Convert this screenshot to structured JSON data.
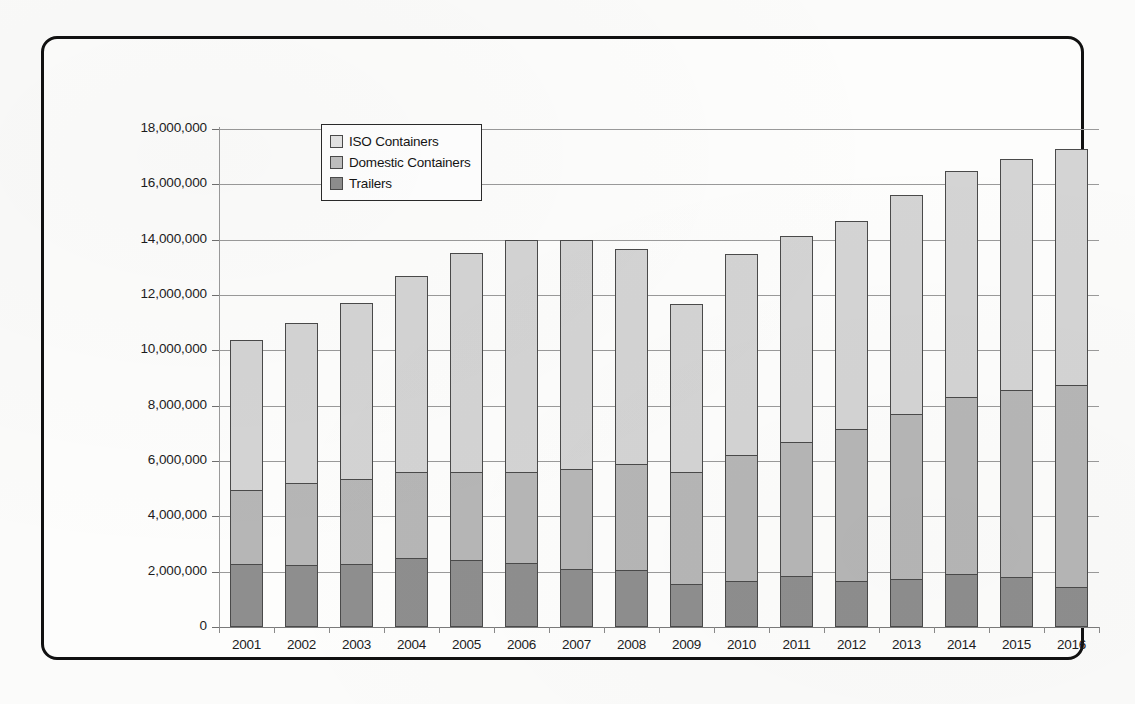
{
  "chart_data": {
    "type": "bar",
    "stacked": true,
    "title": "",
    "xlabel": "",
    "ylabel": "",
    "grid": true,
    "legend_position": "top-left-inside",
    "ylim": [
      0,
      18000000
    ],
    "yticks": [
      0,
      2000000,
      4000000,
      6000000,
      8000000,
      10000000,
      12000000,
      14000000,
      16000000,
      18000000
    ],
    "ytick_labels": [
      "0",
      "2,000,000",
      "4,000,000",
      "6,000,000",
      "8,000,000",
      "10,000,000",
      "12,000,000",
      "14,000,000",
      "16,000,000",
      "18,000,000"
    ],
    "categories": [
      "2001",
      "2002",
      "2003",
      "2004",
      "2005",
      "2006",
      "2007",
      "2008",
      "2009",
      "2010",
      "2011",
      "2012",
      "2013",
      "2014",
      "2015",
      "2016"
    ],
    "series": [
      {
        "name": "Trailers",
        "color": "#8e8e8e",
        "values": [
          2270000,
          2230000,
          2280000,
          2500000,
          2430000,
          2300000,
          2100000,
          2050000,
          1570000,
          1680000,
          1830000,
          1650000,
          1740000,
          1900000,
          1790000,
          1430000
        ]
      },
      {
        "name": "Domestic Containers",
        "color": "#b6b6b6",
        "values": [
          2680000,
          2970000,
          3070000,
          3100000,
          3170000,
          3300000,
          3600000,
          3850000,
          4030000,
          4520000,
          4870000,
          5500000,
          5960000,
          6400000,
          6760000,
          7320000
        ]
      },
      {
        "name": "ISO Containers",
        "color": "#d4d4d4",
        "values": [
          5420000,
          5800000,
          6370000,
          7100000,
          7930000,
          8400000,
          8280000,
          7780000,
          6060000,
          7270000,
          7450000,
          7530000,
          7930000,
          8190000,
          8380000,
          8540000
        ]
      }
    ],
    "stack_tops": {
      "trailers": [
        2270000,
        2230000,
        2280000,
        2500000,
        2430000,
        2300000,
        2100000,
        2050000,
        1570000,
        1680000,
        1830000,
        1650000,
        1740000,
        1900000,
        1790000,
        1430000
      ],
      "domestic": [
        4950000,
        5200000,
        5350000,
        5600000,
        5600000,
        5600000,
        5700000,
        5900000,
        5600000,
        6200000,
        6700000,
        7150000,
        7700000,
        8300000,
        8550000,
        8750000
      ],
      "total": [
        10370000,
        11000000,
        11720000,
        12700000,
        13530000,
        14000000,
        13980000,
        13680000,
        11660000,
        13470000,
        14150000,
        14680000,
        15630000,
        16490000,
        16930000,
        17290000
      ]
    },
    "legend": [
      {
        "label": "ISO Containers",
        "swatch": "iso"
      },
      {
        "label": "Domestic Containers",
        "swatch": "domestic"
      },
      {
        "label": "Trailers",
        "swatch": "trailers"
      }
    ]
  }
}
